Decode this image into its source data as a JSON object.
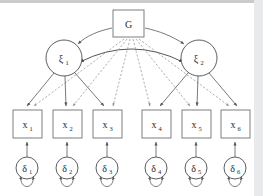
{
  "figure": {
    "type": "path-diagram",
    "background_color": "#ffffff",
    "accent_color": "#55585a"
  },
  "nodes": {
    "general_factor": {
      "id": "G",
      "label": "G",
      "subscript": "",
      "shape": "rectangle",
      "x": 113,
      "y": 10,
      "w": 31,
      "h": 27
    },
    "specific_factors": [
      {
        "id": "xi1",
        "label": "ξ",
        "subscript": "1",
        "shape": "circle",
        "cx": 64,
        "cy": 58,
        "r": 18
      },
      {
        "id": "xi2",
        "label": "ξ",
        "subscript": "2",
        "shape": "circle",
        "cx": 199,
        "cy": 58,
        "r": 18
      }
    ],
    "indicators": [
      {
        "id": "x1",
        "label": "x",
        "subscript": "1",
        "shape": "rectangle",
        "x": 13,
        "y": 110,
        "w": 29,
        "h": 28
      },
      {
        "id": "x2",
        "label": "x",
        "subscript": "2",
        "shape": "rectangle",
        "x": 53,
        "y": 110,
        "w": 29,
        "h": 28
      },
      {
        "id": "x3",
        "label": "x",
        "subscript": "3",
        "shape": "rectangle",
        "x": 93,
        "y": 110,
        "w": 29,
        "h": 28
      },
      {
        "id": "x4",
        "label": "x",
        "subscript": "4",
        "shape": "rectangle",
        "x": 142,
        "y": 110,
        "w": 29,
        "h": 28
      },
      {
        "id": "x5",
        "label": "x",
        "subscript": "5",
        "shape": "rectangle",
        "x": 182,
        "y": 110,
        "w": 29,
        "h": 28
      },
      {
        "id": "x6",
        "label": "x",
        "subscript": "6",
        "shape": "rectangle",
        "x": 221,
        "y": 110,
        "w": 29,
        "h": 28
      }
    ],
    "errors": [
      {
        "id": "d1",
        "label": "δ",
        "subscript": "1",
        "shape": "circle",
        "cx": 27,
        "cy": 168,
        "r": 11
      },
      {
        "id": "d2",
        "label": "δ",
        "subscript": "2",
        "shape": "circle",
        "cx": 67,
        "cy": 168,
        "r": 11
      },
      {
        "id": "d3",
        "label": "δ",
        "subscript": "3",
        "shape": "circle",
        "cx": 107,
        "cy": 168,
        "r": 11
      },
      {
        "id": "d4",
        "label": "δ",
        "subscript": "4",
        "shape": "circle",
        "cx": 156,
        "cy": 168,
        "r": 11
      },
      {
        "id": "d5",
        "label": "δ",
        "subscript": "5",
        "shape": "circle",
        "cx": 196,
        "cy": 168,
        "r": 11
      },
      {
        "id": "d6",
        "label": "δ",
        "subscript": "6",
        "shape": "circle",
        "cx": 235,
        "cy": 168,
        "r": 11
      }
    ]
  },
  "edges": {
    "general_to_specific": [
      {
        "from": "G",
        "to": "xi1",
        "style": "solid",
        "arrow": "single"
      },
      {
        "from": "G",
        "to": "xi2",
        "style": "solid",
        "arrow": "single"
      }
    ],
    "specific_covariance": [
      {
        "from": "xi1",
        "to": "xi2",
        "style": "solid",
        "arrow": "double",
        "shape": "curved"
      }
    ],
    "general_to_indicators": [
      {
        "from": "G",
        "to": "x1",
        "style": "dashed",
        "arrow": "single"
      },
      {
        "from": "G",
        "to": "x2",
        "style": "dashed",
        "arrow": "single"
      },
      {
        "from": "G",
        "to": "x3",
        "style": "dashed",
        "arrow": "single"
      },
      {
        "from": "G",
        "to": "x4",
        "style": "dashed",
        "arrow": "single"
      },
      {
        "from": "G",
        "to": "x5",
        "style": "dashed",
        "arrow": "single"
      },
      {
        "from": "G",
        "to": "x6",
        "style": "dashed",
        "arrow": "single"
      }
    ],
    "specific_to_indicators": [
      {
        "from": "xi1",
        "to": "x1",
        "style": "solid",
        "arrow": "single"
      },
      {
        "from": "xi1",
        "to": "x2",
        "style": "solid",
        "arrow": "single"
      },
      {
        "from": "xi1",
        "to": "x3",
        "style": "solid",
        "arrow": "single"
      },
      {
        "from": "xi2",
        "to": "x4",
        "style": "solid",
        "arrow": "single"
      },
      {
        "from": "xi2",
        "to": "x5",
        "style": "solid",
        "arrow": "single"
      },
      {
        "from": "xi2",
        "to": "x6",
        "style": "solid",
        "arrow": "single"
      }
    ],
    "error_to_indicators": [
      {
        "from": "d1",
        "to": "x1",
        "style": "solid",
        "arrow": "single"
      },
      {
        "from": "d2",
        "to": "x2",
        "style": "solid",
        "arrow": "single"
      },
      {
        "from": "d3",
        "to": "x3",
        "style": "solid",
        "arrow": "single"
      },
      {
        "from": "d4",
        "to": "x4",
        "style": "solid",
        "arrow": "single"
      },
      {
        "from": "d5",
        "to": "x5",
        "style": "solid",
        "arrow": "single"
      },
      {
        "from": "d6",
        "to": "x6",
        "style": "solid",
        "arrow": "single"
      }
    ],
    "error_variances": [
      {
        "on": "d1",
        "style": "solid",
        "arrow": "double",
        "shape": "self-loop"
      },
      {
        "on": "d2",
        "style": "solid",
        "arrow": "double",
        "shape": "self-loop"
      },
      {
        "on": "d3",
        "style": "solid",
        "arrow": "double",
        "shape": "self-loop"
      },
      {
        "on": "d4",
        "style": "solid",
        "arrow": "double",
        "shape": "self-loop"
      },
      {
        "on": "d5",
        "style": "solid",
        "arrow": "double",
        "shape": "self-loop"
      },
      {
        "on": "d6",
        "style": "solid",
        "arrow": "double",
        "shape": "self-loop"
      }
    ]
  }
}
